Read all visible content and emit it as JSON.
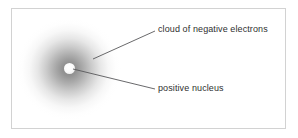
{
  "figure": {
    "background_color": "#ffffff",
    "frame_color": "#d2d2d2"
  },
  "diagram": {
    "type": "atom-model",
    "parts": [
      {
        "id": "electron-cloud",
        "name": "cloud of negative electrons",
        "shape": "radial-gradient-disc",
        "center": [
          69,
          69
        ],
        "radius": 52,
        "color": "#787878"
      },
      {
        "id": "nucleus",
        "name": "positive nucleus",
        "shape": "circle",
        "center": [
          69,
          68
        ],
        "radius": 5,
        "color": "#ffffff"
      }
    ]
  },
  "labels": {
    "cloud": "cloud of negative electrons",
    "nucleus": "positive nucleus"
  },
  "leaders": [
    {
      "id": "leader-cloud",
      "from": [
        93,
        59
      ],
      "to": [
        155,
        31
      ],
      "color": "#58585a",
      "points_to": "electron-cloud"
    },
    {
      "id": "leader-nucleus",
      "from": [
        73,
        69
      ],
      "to": [
        155,
        89
      ],
      "color": "#58585a",
      "points_to": "nucleus"
    }
  ]
}
